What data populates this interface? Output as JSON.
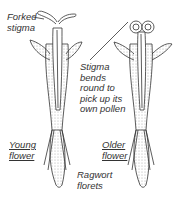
{
  "diagram": {
    "subject": "Ragwort florets",
    "labels": {
      "forked_stigma_line1": "Forked",
      "forked_stigma_line2": "stigma",
      "stigma_bends_line1": "Stigma",
      "stigma_bends_line2": "bends",
      "stigma_bends_line3": "round to",
      "stigma_bends_line4": "pick up its",
      "stigma_bends_line5": "own pollen",
      "young_line1": "Young",
      "young_line2": "flower",
      "older_line1": "Older",
      "older_line2": "flower",
      "ragwort_line1": "Ragwort",
      "ragwort_line2": "florets"
    },
    "colors": {
      "ink": "#333333",
      "stipple": "#9a9a9a",
      "background": "#ffffff"
    }
  }
}
